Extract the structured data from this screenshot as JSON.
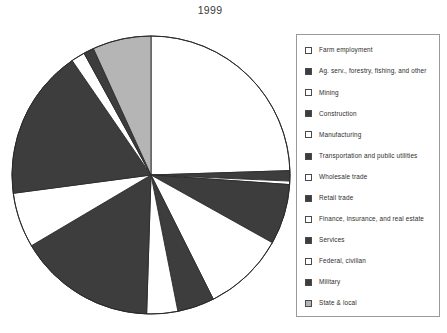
{
  "chart_title": "1999",
  "colors": {
    "dark": "#3d3d3d",
    "white": "#ffffff",
    "light_gray": "#b5b5b5",
    "outline": "#2b2b2b",
    "legend_border": "#9a9a9a",
    "text": "#2e2e2e"
  },
  "legend": {
    "items": [
      {
        "label": "Farm employment",
        "swatch": "white"
      },
      {
        "label": "Ag. serv., forestry, fishing, and other",
        "swatch": "dark"
      },
      {
        "label": "Mining",
        "swatch": "white"
      },
      {
        "label": "Construction",
        "swatch": "dark"
      },
      {
        "label": "Manufacturing",
        "swatch": "white"
      },
      {
        "label": "Transportation and public utilities",
        "swatch": "dark"
      },
      {
        "label": "Wholesale trade",
        "swatch": "white"
      },
      {
        "label": "Retail trade",
        "swatch": "dark"
      },
      {
        "label": "Finance, insurance, and real estate",
        "swatch": "white"
      },
      {
        "label": "Services",
        "swatch": "dark"
      },
      {
        "label": "Federal, civilian",
        "swatch": "white"
      },
      {
        "label": "Military",
        "swatch": "dark"
      },
      {
        "label": "State & local",
        "swatch": "light_gray"
      }
    ]
  },
  "chart_data": {
    "type": "pie",
    "title": "1999",
    "start_angle_deg": 90,
    "direction": "clockwise",
    "legend_position": "right",
    "center": [
      141,
      142
    ],
    "radius": 139,
    "categories": [
      "Farm employment",
      "Ag. serv., forestry, fishing, and other",
      "Mining",
      "Construction",
      "Manufacturing",
      "Transportation and public utilities",
      "Wholesale trade",
      "Retail trade",
      "Finance, insurance, and real estate",
      "Services",
      "Federal, civilian",
      "Military",
      "State & local"
    ],
    "values": [
      24.5,
      1.2,
      0.4,
      7.0,
      9.5,
      4.3,
      3.6,
      16.0,
      6.4,
      17.5,
      1.6,
      1.2,
      6.8
    ],
    "units": "percent of total employment",
    "slices": [
      {
        "name": "Farm employment",
        "percent": 24.5,
        "fill": "white"
      },
      {
        "name": "Ag. serv., forestry, fishing, and other",
        "percent": 1.2,
        "fill": "dark"
      },
      {
        "name": "Mining",
        "percent": 0.4,
        "fill": "white"
      },
      {
        "name": "Construction",
        "percent": 7.0,
        "fill": "dark"
      },
      {
        "name": "Manufacturing",
        "percent": 9.5,
        "fill": "white"
      },
      {
        "name": "Transportation and public utilities",
        "percent": 4.3,
        "fill": "dark"
      },
      {
        "name": "Wholesale trade",
        "percent": 3.6,
        "fill": "white"
      },
      {
        "name": "Retail trade",
        "percent": 16.0,
        "fill": "dark"
      },
      {
        "name": "Finance, insurance, and real estate",
        "percent": 6.4,
        "fill": "white"
      },
      {
        "name": "Services",
        "percent": 17.5,
        "fill": "dark"
      },
      {
        "name": "Federal, civilian",
        "percent": 1.6,
        "fill": "white"
      },
      {
        "name": "Military",
        "percent": 1.2,
        "fill": "dark"
      },
      {
        "name": "State & local",
        "percent": 6.8,
        "fill": "light_gray"
      }
    ]
  }
}
